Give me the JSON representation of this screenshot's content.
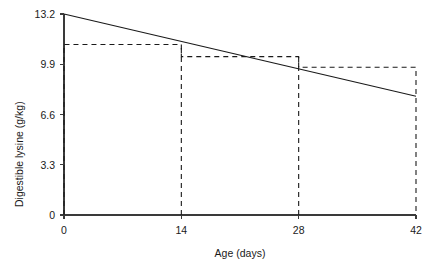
{
  "chart_data": {
    "type": "line",
    "title": "",
    "xlabel": "Age (days)",
    "ylabel": "Digestible lysine (g/kg)",
    "xlim": [
      0,
      42
    ],
    "ylim": [
      0,
      13.2
    ],
    "grid": false,
    "legend": null,
    "xticks": [
      0,
      14,
      28,
      42
    ],
    "xtick_labels": [
      "0",
      "14",
      "28",
      "42"
    ],
    "yticks": [
      0,
      3.3,
      6.6,
      9.9,
      13.2
    ],
    "ytick_labels": [
      "0",
      "3.3",
      "6.6",
      "9.9",
      "13.2"
    ],
    "series": [
      {
        "name": "Requirement curve",
        "style": "solid",
        "color": "#1a1a1a",
        "x": [
          0,
          42
        ],
        "values": [
          13.2,
          7.8
        ]
      },
      {
        "name": "Phase feeding steps",
        "style": "dashed",
        "color": "#1a1a1a",
        "steps": [
          {
            "x_start": 0,
            "x_end": 14,
            "value": 11.2
          },
          {
            "x_start": 14,
            "x_end": 28,
            "value": 10.4
          },
          {
            "x_start": 28,
            "x_end": 42,
            "value": 9.7
          }
        ]
      }
    ]
  },
  "axis": {
    "x_title": "Age (days)",
    "y_title": "Digestible lysine (g/kg)"
  }
}
